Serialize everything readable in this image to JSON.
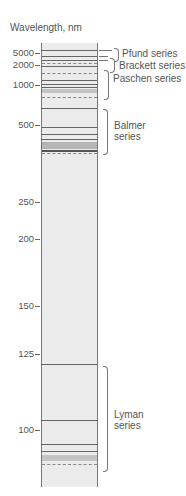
{
  "title": "Wavelength, nm",
  "axis_ticks": [
    {
      "label": "5000",
      "y": 53
    },
    {
      "label": "2000",
      "y": 65
    },
    {
      "label": "1000",
      "y": 85
    },
    {
      "label": "500",
      "y": 125
    },
    {
      "label": "250",
      "y": 202
    },
    {
      "label": "200",
      "y": 239
    },
    {
      "label": "150",
      "y": 306
    },
    {
      "label": "125",
      "y": 354
    },
    {
      "label": "100",
      "y": 430
    }
  ],
  "series": [
    {
      "name": "Pfund series",
      "label": "Pfund series"
    },
    {
      "name": "Brackett series",
      "label": "Brackett series"
    },
    {
      "name": "Paschen series",
      "label": "Paschen series"
    },
    {
      "name": "Balmer series",
      "label_line1": "Balmer",
      "label_line2": "series"
    },
    {
      "name": "Lyman series",
      "label_line1": "Lyman",
      "label_line2": "series"
    }
  ],
  "colors": {
    "column_fill": "#ebebeb",
    "line": "#666666",
    "text": "#555555"
  }
}
